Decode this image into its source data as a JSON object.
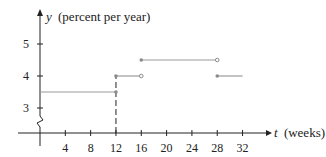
{
  "chart_data": {
    "type": "line",
    "subtype": "step-function",
    "title": "",
    "xlabel": "t (weeks)",
    "ylabel": "y (percent per year)",
    "xlabel_var": "t",
    "xlabel_unit": "(weeks)",
    "ylabel_var": "y",
    "ylabel_unit": "(percent per year)",
    "x_ticks": [
      4,
      8,
      12,
      16,
      20,
      24,
      28,
      32
    ],
    "y_ticks": [
      3,
      4,
      5
    ],
    "xlim": [
      0,
      36
    ],
    "ylim": [
      2.5,
      5.5
    ],
    "y_axis_break": true,
    "grid": false,
    "segments": [
      {
        "x_start": 0,
        "x_end": 12,
        "y": 3.5,
        "start": "none",
        "end": "closed"
      },
      {
        "x_start": 12,
        "x_end": 16,
        "y": 4.0,
        "start": "closed",
        "end": "open"
      },
      {
        "x_start": 16,
        "x_end": 28,
        "y": 4.5,
        "start": "closed",
        "end": "open"
      },
      {
        "x_start": 28,
        "x_end": 32,
        "y": 4.0,
        "start": "closed",
        "end": "none"
      }
    ],
    "dashed_vertical": {
      "x": 12,
      "y_from": 0,
      "y_to": 4.0
    },
    "colors": {
      "axis": "#222222",
      "segment": "#9a9a9a",
      "dot": "#8a8a8a"
    }
  }
}
